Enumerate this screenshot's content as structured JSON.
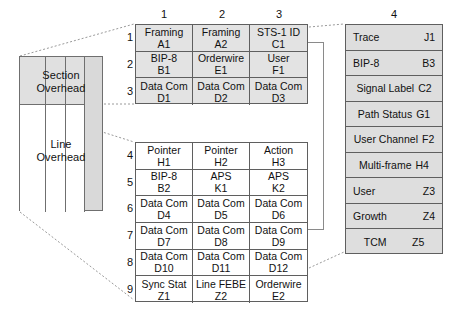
{
  "figure": {
    "colors": {
      "section_fill": "#e3e3e3",
      "line_fill": "#ffffff",
      "path_fill": "#dedede",
      "schematic_section_fill": "#e0e0e0",
      "schematic_path_fill": "#d9d9d9",
      "stroke": "#5f5f5f",
      "leader": "#9a9a9a"
    }
  },
  "schematic": {
    "section_label_line1": "Section",
    "section_label_line2": "Overhead",
    "line_label_line1": "Line",
    "line_label_line2": "Overhead"
  },
  "column_numbers": [
    "1",
    "2",
    "3",
    "4"
  ],
  "row_numbers": [
    "1",
    "2",
    "3",
    "4",
    "5",
    "6",
    "7",
    "8",
    "9"
  ],
  "section_overhead": {
    "rows": [
      [
        {
          "name": "Framing",
          "code": "A1"
        },
        {
          "name": "Framing",
          "code": "A2"
        },
        {
          "name": "STS-1 ID",
          "code": "C1"
        }
      ],
      [
        {
          "name": "BIP-8",
          "code": "B1"
        },
        {
          "name": "Orderwire",
          "code": "E1"
        },
        {
          "name": "User",
          "code": "F1"
        }
      ],
      [
        {
          "name": "Data Com",
          "code": "D1"
        },
        {
          "name": "Data Com",
          "code": "D2"
        },
        {
          "name": "Data Com",
          "code": "D3"
        }
      ]
    ]
  },
  "line_overhead": {
    "rows": [
      [
        {
          "name": "Pointer",
          "code": "H1"
        },
        {
          "name": "Pointer",
          "code": "H2"
        },
        {
          "name": "Action",
          "code": "H3"
        }
      ],
      [
        {
          "name": "BIP-8",
          "code": "B2"
        },
        {
          "name": "APS",
          "code": "K1"
        },
        {
          "name": "APS",
          "code": "K2"
        }
      ],
      [
        {
          "name": "Data Com",
          "code": "D4"
        },
        {
          "name": "Data Com",
          "code": "D5"
        },
        {
          "name": "Data Com",
          "code": "D6"
        }
      ],
      [
        {
          "name": "Data Com",
          "code": "D7"
        },
        {
          "name": "Data Com",
          "code": "D8"
        },
        {
          "name": "Data Com",
          "code": "D9"
        }
      ],
      [
        {
          "name": "Data Com",
          "code": "D10"
        },
        {
          "name": "Data Com",
          "code": "D11"
        },
        {
          "name": "Data Com",
          "code": "D12"
        }
      ],
      [
        {
          "name": "Sync Stat",
          "code": "Z1"
        },
        {
          "name": "Line FEBE",
          "code": "Z2"
        },
        {
          "name": "Orderwire",
          "code": "E2"
        }
      ]
    ]
  },
  "path_overhead": {
    "rows": [
      {
        "name": "Trace",
        "code": "J1",
        "layout": "split"
      },
      {
        "name": "BIP-8",
        "code": "B3",
        "layout": "split"
      },
      {
        "name": "Signal Label",
        "code": "C2",
        "layout": "center"
      },
      {
        "name": "Path  Status",
        "code": "G1",
        "layout": "center"
      },
      {
        "name": "User Channel",
        "code": "F2",
        "layout": "center"
      },
      {
        "name": "Multi-frame",
        "code": "H4",
        "layout": "center"
      },
      {
        "name": "User",
        "code": "Z3",
        "layout": "split"
      },
      {
        "name": "Growth",
        "code": "Z4",
        "layout": "split"
      },
      {
        "name": "TCM",
        "code": "Z5",
        "layout": "centersplit"
      }
    ]
  }
}
